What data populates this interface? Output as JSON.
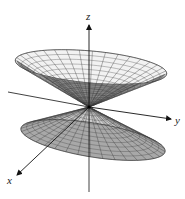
{
  "figure": {
    "surface": "double-cone",
    "colors": {
      "background": "#ffffff",
      "mesh_line": "#3a3a3a",
      "outer_fill": "#f2f2f2",
      "inner_fill": "#8a8a8a",
      "lower_fill": "#a8a8a8",
      "axis": "#111111"
    },
    "origin": [
      89,
      107
    ],
    "axes": {
      "x": {
        "label": "x"
      },
      "y": {
        "label": "y"
      },
      "z": {
        "label": "z"
      }
    },
    "mesh": {
      "radial_lines": 36,
      "rings": 12
    }
  }
}
